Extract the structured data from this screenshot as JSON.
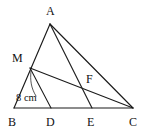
{
  "figure": {
    "background_color": "#ffffff",
    "line_color": "#1a1a1a",
    "width": 149,
    "height": 133
  },
  "points": {
    "A": {
      "label": "A",
      "x": 50,
      "y": 24,
      "label_x": 46,
      "label_y": 15
    },
    "B": {
      "label": "B",
      "x": 14,
      "y": 108,
      "label_x": 8,
      "label_y": 126
    },
    "C": {
      "label": "C",
      "x": 133,
      "y": 108,
      "label_x": 129,
      "label_y": 126
    },
    "M": {
      "label": "M",
      "x": 30,
      "y": 68,
      "label_x": 12,
      "label_y": 62
    },
    "D": {
      "label": "D",
      "x": 51,
      "y": 108,
      "label_x": 46,
      "label_y": 126
    },
    "E": {
      "label": "E",
      "x": 92,
      "y": 108,
      "label_x": 87,
      "label_y": 126
    },
    "F": {
      "label": "F",
      "x": 84,
      "y": 85,
      "label_x": 86,
      "label_y": 83
    }
  },
  "segments": [
    {
      "name": "side-AB",
      "from": "A",
      "to": "B",
      "kind": "edge"
    },
    {
      "name": "side-BC",
      "from": "B",
      "to": "C",
      "kind": "edge"
    },
    {
      "name": "side-AC",
      "from": "A",
      "to": "C",
      "kind": "edge"
    },
    {
      "name": "cevian-AE",
      "from": "A",
      "to": "E",
      "kind": "cevian"
    },
    {
      "name": "cevian-MC",
      "from": "M",
      "to": "C",
      "kind": "cevian"
    },
    {
      "name": "cevian-MD",
      "from": "M",
      "to": "D",
      "kind": "cevian"
    }
  ],
  "annotations": {
    "measure": {
      "text": "8 cm",
      "x": 16,
      "y": 101,
      "leader_path": "M 31 71 C 30 80 31 88 36 96"
    }
  }
}
